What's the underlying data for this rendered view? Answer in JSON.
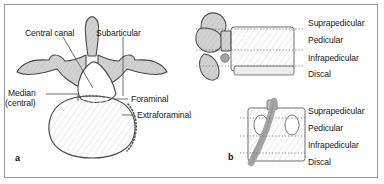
{
  "figure": {
    "background_color": "#ffffff",
    "border_color": "#9a9a9a",
    "bone_fill": "#d4d4d4",
    "body_fill": "#f2f2f2",
    "nerve_fill": "#a9a9a9",
    "outline_color": "#4a4a4a",
    "text_color": "#1a1a1a"
  },
  "panel_a": {
    "letter": "a",
    "view": "axial",
    "labels": {
      "central_canal": "Central canal",
      "subarticular": "Subarticular",
      "median": "Median",
      "median_second_line": "(central)",
      "foraminal": "Foraminal",
      "extraforaminal": "Extraforaminal"
    }
  },
  "panel_b": {
    "letter": "b",
    "views": [
      "sagittal",
      "coronal"
    ],
    "zones_top": [
      "Suprapedicular",
      "Pedicular",
      "Infrapedicular",
      "Discal"
    ],
    "zones_bottom": [
      "Suprapedicular",
      "Pedicular",
      "Infrapedicular",
      "Discal"
    ]
  }
}
